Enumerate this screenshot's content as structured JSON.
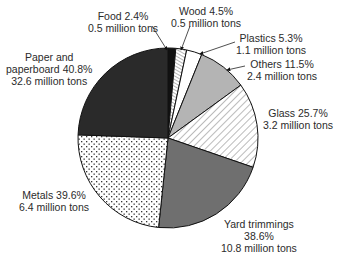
{
  "chart_data": {
    "type": "pie",
    "title": "",
    "center": [
      168,
      138
    ],
    "radius": 90,
    "slices": [
      {
        "name": "Food",
        "percent_label": "Food 2.4%",
        "tons_label": "0.5 million tons",
        "percent": 2.4,
        "million_tons": 0.5,
        "start_deg": 0,
        "end_deg": 5,
        "fill": "#111111",
        "pattern": "solid"
      },
      {
        "name": "Wood",
        "percent_label": "Wood 4.5%",
        "tons_label": "0.5 million tons",
        "percent": 4.5,
        "million_tons": 0.5,
        "start_deg": 5,
        "end_deg": 12,
        "fill": "#ffffff",
        "pattern": "hatch-dense"
      },
      {
        "name": "Plastics",
        "percent_label": "Plastics 5.3%",
        "tons_label": "1.1 million tons",
        "percent": 5.3,
        "million_tons": 1.1,
        "start_deg": 12,
        "end_deg": 22,
        "fill": "#ffffff",
        "pattern": "solid"
      },
      {
        "name": "Others",
        "percent_label": "Others 11.5%",
        "tons_label": "2.4 million tons",
        "percent": 11.5,
        "million_tons": 2.4,
        "start_deg": 22,
        "end_deg": 54,
        "fill": "#b4b4b4",
        "pattern": "solid"
      },
      {
        "name": "Glass",
        "percent_label": "Glass 25.7%",
        "tons_label": "3.2 million tons",
        "percent": 25.7,
        "million_tons": 3.2,
        "start_deg": 54,
        "end_deg": 109,
        "fill": "#ffffff",
        "pattern": "hatch"
      },
      {
        "name": "Yard trimmings",
        "percent_label": "Yard trimmings",
        "percent_label2": "38.6%",
        "tons_label": "10.8 million tons",
        "percent": 38.6,
        "million_tons": 10.8,
        "start_deg": 109,
        "end_deg": 186,
        "fill": "#6f6f6f",
        "pattern": "solid"
      },
      {
        "name": "Metals",
        "percent_label": "Metals 39.6%",
        "tons_label": "6.4 million tons",
        "percent": 39.6,
        "million_tons": 6.4,
        "start_deg": 186,
        "end_deg": 272,
        "fill": "#ffffff",
        "pattern": "dots"
      },
      {
        "name": "Paper and paperboard",
        "percent_label": "Paper and",
        "percent_label2": "paperboard 40.8%",
        "tons_label": "32.6 million tons",
        "percent": 40.8,
        "million_tons": 32.6,
        "start_deg": 272,
        "end_deg": 360,
        "fill": "#2a2a2a",
        "pattern": "solid"
      }
    ],
    "legend": "none (direct labels with leader arrows)"
  }
}
